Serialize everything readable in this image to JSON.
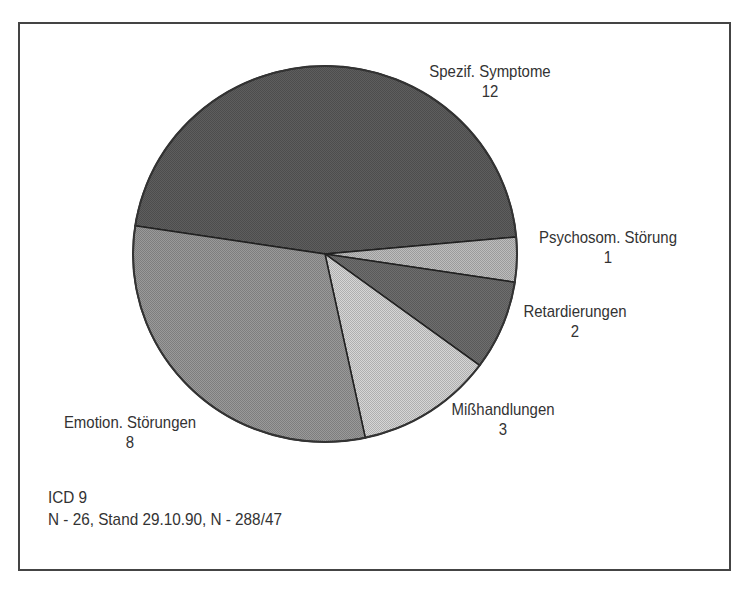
{
  "chart_data": {
    "type": "pie",
    "title": "",
    "categories": [
      "Spezif. Symptome",
      "Psychosom. Störung",
      "Retardierungen",
      "Mißhandlungen",
      "Emotion. Störungen"
    ],
    "values": [
      12,
      1,
      2,
      3,
      8
    ],
    "total": 26,
    "colors": [
      "#5e5e5e",
      "#bdbdbd",
      "#6e6e6e",
      "#d6d6d6",
      "#9a9a9a"
    ],
    "labels": [
      {
        "name": "Spezif. Symptome",
        "value": "12"
      },
      {
        "name": "Psychosom. Störung",
        "value": "1"
      },
      {
        "name": "Retardierungen",
        "value": "2"
      },
      {
        "name": "Mißhandlungen",
        "value": "3"
      },
      {
        "name": "Emotion. Störungen",
        "value": "8"
      }
    ],
    "legend": "none (slice labels placed outside)",
    "annotations": [
      "ICD 9",
      "N - 26, Stand 29.10.90, N - 288/47"
    ]
  },
  "footnote": {
    "line1": "ICD 9",
    "line2": "N - 26, Stand 29.10.90, N - 288/47"
  }
}
